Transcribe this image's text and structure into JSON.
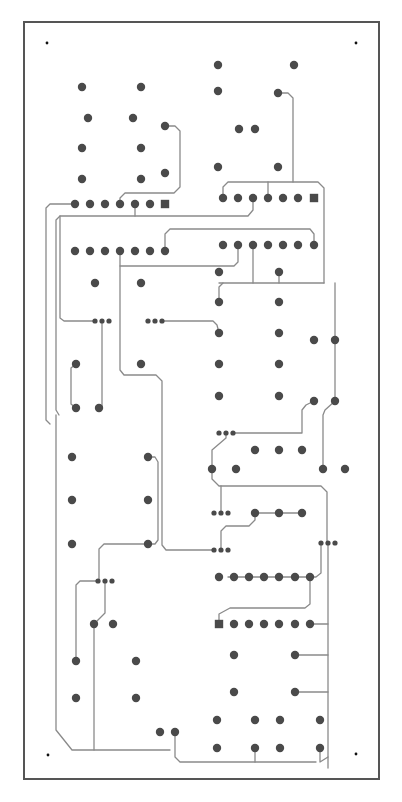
{
  "diagram": {
    "type": "pcb-layout",
    "caption": "",
    "colors": {
      "outline": "#555555",
      "trace": "#8a8a8a",
      "pad": "#4a4a4a",
      "mount_hole": "#111111",
      "background": "#ffffff"
    },
    "outline": {
      "x": 24,
      "y": 22,
      "w": 355,
      "h": 757
    },
    "mount_holes": [
      [
        47,
        43
      ],
      [
        356,
        43
      ],
      [
        48,
        755
      ],
      [
        356,
        754
      ]
    ],
    "pads_round": [
      [
        82,
        87
      ],
      [
        141,
        87
      ],
      [
        88,
        118
      ],
      [
        133,
        118
      ],
      [
        82,
        148
      ],
      [
        141,
        148
      ],
      [
        82,
        179
      ],
      [
        141,
        179
      ],
      [
        165,
        126
      ],
      [
        165,
        173
      ],
      [
        218,
        65
      ],
      [
        294,
        65
      ],
      [
        218,
        91
      ],
      [
        278,
        93
      ],
      [
        239,
        129
      ],
      [
        255,
        129
      ],
      [
        218,
        167
      ],
      [
        278,
        167
      ],
      [
        75,
        204
      ],
      [
        90,
        204
      ],
      [
        105,
        204
      ],
      [
        120,
        204
      ],
      [
        135,
        204
      ],
      [
        150,
        204
      ],
      [
        223,
        198
      ],
      [
        238,
        198
      ],
      [
        253,
        198
      ],
      [
        268,
        198
      ],
      [
        283,
        198
      ],
      [
        298,
        198
      ],
      [
        75,
        251
      ],
      [
        90,
        251
      ],
      [
        105,
        251
      ],
      [
        120,
        251
      ],
      [
        135,
        251
      ],
      [
        150,
        251
      ],
      [
        165,
        251
      ],
      [
        223,
        245
      ],
      [
        238,
        245
      ],
      [
        253,
        245
      ],
      [
        268,
        245
      ],
      [
        283,
        245
      ],
      [
        298,
        245
      ],
      [
        314,
        245
      ],
      [
        95,
        283
      ],
      [
        141,
        283
      ],
      [
        219,
        272
      ],
      [
        279,
        272
      ],
      [
        219,
        302
      ],
      [
        279,
        302
      ],
      [
        219,
        333
      ],
      [
        279,
        333
      ],
      [
        314,
        340
      ],
      [
        335,
        340
      ],
      [
        219,
        364
      ],
      [
        279,
        364
      ],
      [
        76,
        364
      ],
      [
        141,
        364
      ],
      [
        76,
        408
      ],
      [
        99,
        408
      ],
      [
        219,
        396
      ],
      [
        279,
        396
      ],
      [
        314,
        401
      ],
      [
        335,
        401
      ],
      [
        255,
        450
      ],
      [
        279,
        450
      ],
      [
        302,
        450
      ],
      [
        212,
        469
      ],
      [
        236,
        469
      ],
      [
        323,
        469
      ],
      [
        345,
        469
      ],
      [
        72,
        457
      ],
      [
        148,
        457
      ],
      [
        72,
        500
      ],
      [
        148,
        500
      ],
      [
        72,
        544
      ],
      [
        148,
        544
      ],
      [
        255,
        513
      ],
      [
        279,
        513
      ],
      [
        302,
        513
      ],
      [
        219,
        577
      ],
      [
        234,
        577
      ],
      [
        249,
        577
      ],
      [
        264,
        577
      ],
      [
        279,
        577
      ],
      [
        295,
        577
      ],
      [
        310,
        577
      ],
      [
        234,
        624
      ],
      [
        249,
        624
      ],
      [
        264,
        624
      ],
      [
        279,
        624
      ],
      [
        295,
        624
      ],
      [
        310,
        624
      ],
      [
        94,
        624
      ],
      [
        113,
        624
      ],
      [
        76,
        661
      ],
      [
        136,
        661
      ],
      [
        234,
        655
      ],
      [
        295,
        655
      ],
      [
        76,
        698
      ],
      [
        136,
        698
      ],
      [
        234,
        692
      ],
      [
        295,
        692
      ],
      [
        160,
        732
      ],
      [
        175,
        732
      ],
      [
        217,
        720
      ],
      [
        255,
        720
      ],
      [
        280,
        720
      ],
      [
        320,
        720
      ],
      [
        217,
        748
      ],
      [
        255,
        748
      ],
      [
        280,
        748
      ],
      [
        320,
        748
      ]
    ],
    "pads_square": [
      [
        165,
        204
      ],
      [
        314,
        198
      ],
      [
        219,
        624
      ]
    ],
    "pads_small": [
      [
        95,
        321
      ],
      [
        102,
        321
      ],
      [
        109,
        321
      ],
      [
        148,
        321
      ],
      [
        155,
        321
      ],
      [
        162,
        321
      ],
      [
        219,
        433
      ],
      [
        226,
        433
      ],
      [
        233,
        433
      ],
      [
        214,
        513
      ],
      [
        221,
        513
      ],
      [
        228,
        513
      ],
      [
        214,
        550
      ],
      [
        221,
        550
      ],
      [
        228,
        550
      ],
      [
        321,
        543
      ],
      [
        328,
        543
      ],
      [
        335,
        543
      ],
      [
        98,
        581
      ],
      [
        105,
        581
      ],
      [
        112,
        581
      ]
    ],
    "traces": [
      "M165,126 L175,126 L180,131 L180,187 L174,193 L125,193 L120,198 L120,204",
      "M278,93 L288,93 L293,98 L293,182",
      "M223,198 L223,187 L228,182 L318,182 L324,188 L324,283",
      "M268,198 L268,182",
      "M253,198 L253,210 L248,216 L60,216 L56,220 L56,410 L59,415",
      "M75,204 L50,204 L46,208 L46,420 L50,424",
      "M135,204 L135,216",
      "M60,216 L60,318 L64,321 L95,321",
      "M165,251 L165,234 L170,229 L310,229 L314,234 L314,245",
      "M238,245 L238,262 L234,266 L120,266",
      "M120,251 L120,370 L124,375 L156,375 L162,381 L162,545 L166,550 L214,550",
      "M253,245 L253,283",
      "M279,272 L279,283",
      "M223,283 L219,287 L219,302",
      "M219,283 L324,283",
      "M162,321 L213,321 L217,325 L219,333",
      "M102,321 L102,408",
      "M76,364 L71,368 L71,404 L76,408",
      "M102,408 L99,408",
      "M335,340 L335,283",
      "M335,340 L335,401",
      "M314,401 L306,405 L302,410 L302,433 L233,433",
      "M226,433 L226,438 L212,450 L212,469",
      "M335,401 L325,410 L323,415 L323,469",
      "M212,469 L212,479 L219,486 L321,486 L327,492 L327,543",
      "M221,486 L221,513",
      "M255,513 L302,513",
      "M255,513 L255,520 L249,526 L226,526 L221,531 L221,550",
      "M148,457 L155,457 L158,462 L158,540 L155,544 L148,544",
      "M148,544 L104,544 L99,549 L99,581",
      "M98,581 L80,581 L76,585 L76,661",
      "M105,581 L105,613 L99,619 L94,624",
      "M94,624 L94,750",
      "M56,415 L56,730 L72,750 L170,750",
      "M175,732 L175,757 L180,762 L316,762",
      "M321,543 L321,573 L316,577 L228,577",
      "M328,543 L328,768",
      "M310,577 L310,604 L305,608 L230,608 L219,614 L219,624",
      "M310,624 L328,624",
      "M295,655 L328,655",
      "M295,692 L328,692",
      "M255,748 L255,762",
      "M320,748 L320,762 L328,757"
    ]
  }
}
